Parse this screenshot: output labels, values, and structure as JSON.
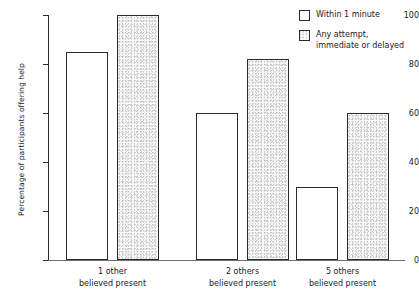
{
  "chart_data": {
    "type": "bar",
    "title": "",
    "xlabel": "",
    "ylabel": "Percentage of participants offering help",
    "ylim": [
      0,
      100
    ],
    "yticks": [
      0,
      20,
      40,
      60,
      80,
      100
    ],
    "grid": false,
    "legend_position": "top-right",
    "categories": [
      {
        "line1": "1 other",
        "line2": "believed present"
      },
      {
        "line1": "2 others",
        "line2": "believed present"
      },
      {
        "line1": "5 others",
        "line2": "believed present"
      }
    ],
    "series": [
      {
        "name": "Within 1 minute",
        "legend_line1": "Within 1 minute",
        "legend_line2": "",
        "fill": "white",
        "values": [
          85,
          60,
          30
        ]
      },
      {
        "name": "Any attempt, immediate or delayed",
        "legend_line1": "Any attempt,",
        "legend_line2": "immediate or delayed",
        "fill": "stippled",
        "values": [
          100,
          82,
          60
        ]
      }
    ]
  },
  "axis": {
    "tick_labels": [
      "0",
      "20",
      "40",
      "60",
      "80",
      "100"
    ]
  },
  "colors": {
    "bar_outline": "#2b2b2b",
    "bar_white_fill": "#ffffff",
    "bar_shaded_fill": "#fafafa",
    "axis": "#2b2b2b",
    "text": "#1a1a1a",
    "background": "#ffffff"
  }
}
